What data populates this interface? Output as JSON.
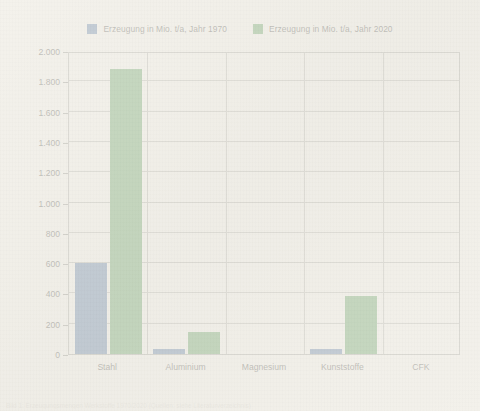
{
  "figure": {
    "background_color": "#f2f0ea",
    "plot_border_color": "#9a9a95",
    "grid_color": "#a8a8a2"
  },
  "legend": {
    "position": "top-center",
    "entries": [
      {
        "label": "Erzeugung in Mio. t/a, Jahr 1970",
        "color": "#3a6196",
        "icon": "legend-swatch-icon"
      },
      {
        "label": "Erzeugung in Mio. t/a, Jahr 2020",
        "color": "#418c42",
        "icon": "legend-swatch-icon"
      }
    ]
  },
  "caption": {
    "text": "Bild 1: Erzeugungsmengen Werkstoffe 1970/2020 (Quellen: siehe Literaturverzeichnis)"
  },
  "chart_data": {
    "type": "bar",
    "title": "",
    "subtitle": "",
    "xlabel": "",
    "ylabel": "",
    "categories": [
      "Stahl",
      "Aluminium",
      "Magnesium",
      "Kunststoffe",
      "CFK"
    ],
    "series": [
      {
        "name": "Erzeugung in Mio. t/a, Jahr 1970",
        "color": "#3a6196",
        "values": [
          600,
          30,
          0,
          30,
          0
        ]
      },
      {
        "name": "Erzeugung in Mio. t/a, Jahr 2020",
        "color": "#418c42",
        "values": [
          1880,
          145,
          0,
          385,
          0
        ]
      }
    ],
    "ylim": [
      0,
      2000
    ],
    "ytick_values": [
      0,
      200,
      400,
      600,
      800,
      1000,
      1200,
      1400,
      1600,
      1800,
      2000
    ],
    "ytick_labels": [
      "0",
      "200",
      "400",
      "600",
      "800",
      "1.000",
      "1.200",
      "1.400",
      "1.600",
      "1.800",
      "2.000"
    ],
    "grid": "horizontal-and-category-separators",
    "legend_position": "top-center"
  }
}
